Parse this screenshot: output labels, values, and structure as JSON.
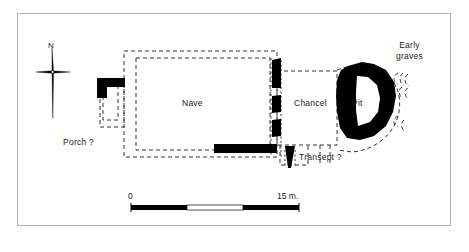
{
  "figure": {
    "type": "archaeological-site-plan",
    "background_color": "#ffffff",
    "frame_color": "#b4b4b4",
    "wall_color": "#000000",
    "conjecture_line_style": "dashed"
  },
  "compass": {
    "label": "N",
    "icon": "compass-cross-icon"
  },
  "labels": {
    "porch": "Porch ?",
    "nave": "Nave",
    "chancel": "Chancel",
    "transept": "Transept ?",
    "pit": "Pit",
    "early_graves": "Early\ngraves",
    "early_graves_line1": "Early",
    "early_graves_line2": "graves"
  },
  "scale_bar": {
    "start_label": "0",
    "end_label": "15 m.",
    "units": "m.",
    "total_length_m": 15,
    "segments": 3
  }
}
